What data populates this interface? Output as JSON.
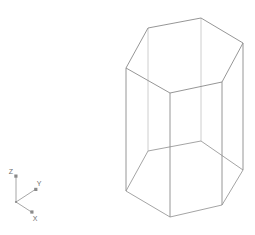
{
  "viewport": {
    "name": "3d-wireframe-viewport",
    "background_color": "#ffffff",
    "width": 255,
    "height": 235
  },
  "model": {
    "name": "hexagonal-prism",
    "shape": "hexagonal prism",
    "render_mode": "wireframe",
    "visible_edge_color": "#8a8a8a",
    "hidden_edge_color": "#c8c8c8",
    "fill_color": "none",
    "stroke_width": 0.9,
    "top_face": {
      "label": "top-hexagon",
      "points": "126,68 148,28 201,18 243,43 222,82 170,93"
    },
    "bottom_face": {
      "label": "bottom-hexagon",
      "points": "126,191 148,151 201,141 243,170 222,205 170,217"
    },
    "vertical_edges": [
      {
        "label": "edge-left",
        "x1": 126,
        "y1": 68,
        "x2": 126,
        "y2": 191,
        "hidden": false
      },
      {
        "label": "edge-back-left",
        "x1": 148,
        "y1": 28,
        "x2": 148,
        "y2": 151,
        "hidden": true
      },
      {
        "label": "edge-back-right",
        "x1": 201,
        "y1": 18,
        "x2": 201,
        "y2": 141,
        "hidden": true
      },
      {
        "label": "edge-right",
        "x1": 243,
        "y1": 43,
        "x2": 243,
        "y2": 170,
        "hidden": false
      },
      {
        "label": "edge-front-right",
        "x1": 222,
        "y1": 82,
        "x2": 222,
        "y2": 205,
        "hidden": false
      },
      {
        "label": "edge-front-left",
        "x1": 170,
        "y1": 93,
        "x2": 170,
        "y2": 217,
        "hidden": false
      }
    ]
  },
  "axis_gizmo": {
    "name": "axis-orientation-gizmo",
    "origin": {
      "x": 16,
      "y": 202
    },
    "color": "#808080",
    "axes": [
      {
        "id": "z",
        "label": "Z",
        "tip_x": 16,
        "tip_y": 176,
        "label_x": 11,
        "label_y": 174
      },
      {
        "id": "y",
        "label": "Y",
        "tip_x": 36,
        "tip_y": 189,
        "label_x": 39,
        "label_y": 186
      },
      {
        "id": "x",
        "label": "X",
        "tip_x": 33,
        "tip_y": 213,
        "label_x": 35,
        "label_y": 221
      }
    ]
  }
}
